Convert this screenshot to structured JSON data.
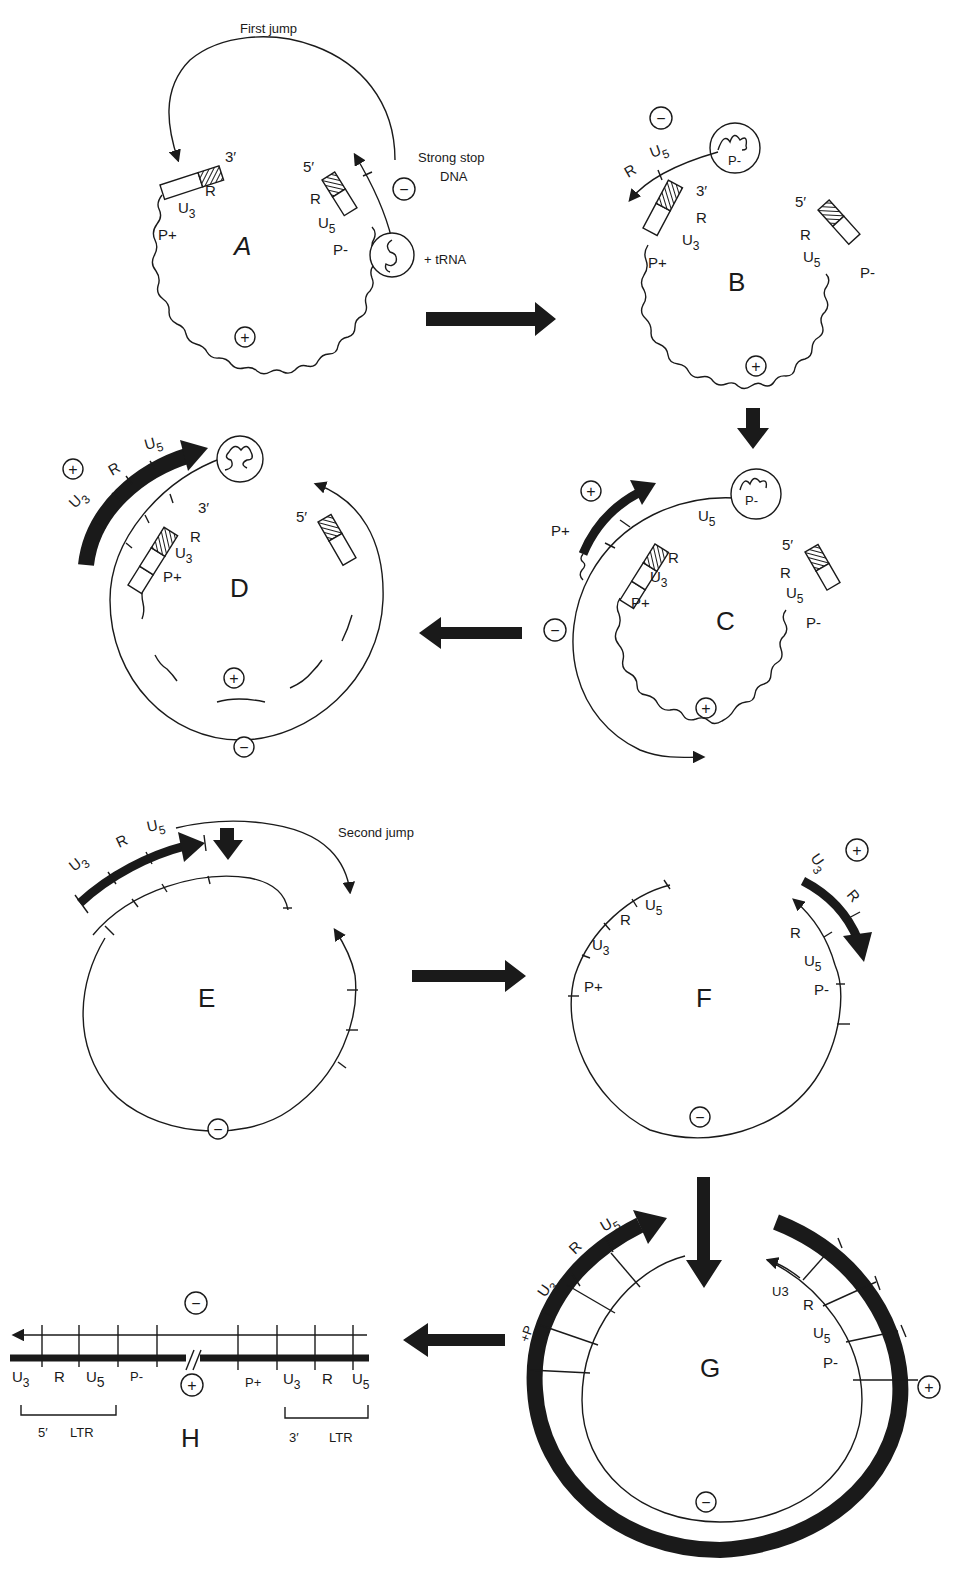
{
  "figure": {
    "ink_color": "#1a1a1a",
    "background": "#ffffff"
  },
  "panels": {
    "A": {
      "letter": "A",
      "title": "First   jump",
      "strong_stop": [
        "Strong stop",
        "DNA"
      ],
      "labels": {
        "three_prime": "3′",
        "five_prime": "5′",
        "R_left": "R",
        "U3": "U",
        "U3_sub": "3",
        "P_plus": "P+",
        "R_right": "R",
        "U5": "U",
        "U5_sub": "5",
        "P_minus": "P-",
        "trna": "+ tRNA"
      },
      "signs": {
        "minus": "−",
        "plus": "+"
      }
    },
    "B": {
      "letter": "B",
      "labels": {
        "R_growing": "R",
        "U5_growing": "U",
        "U5_growing_sub": "5",
        "primer": "P-",
        "three_prime": "3′",
        "R_left": "R",
        "U3": "U",
        "U3_sub": "3",
        "P_plus": "P+",
        "five_prime": "5′",
        "R_right": "R",
        "U5": "U",
        "U5_sub": "5",
        "P_minus": "P-"
      },
      "signs": {
        "minus": "−",
        "plus": "+"
      }
    },
    "C": {
      "letter": "C",
      "labels": {
        "P_plus_new": "P+",
        "U5_top": "U",
        "U5_top_sub": "5",
        "primer": "P-",
        "R_left": "R",
        "U3": "U",
        "U3_sub": "3",
        "P_plus": "P+",
        "five_prime": "5′",
        "R_right": "R",
        "U5": "U",
        "U5_sub": "5",
        "P_minus": "P-"
      },
      "signs": {
        "plus_top": "+",
        "minus": "−",
        "plus": "+"
      }
    },
    "D": {
      "letter": "D",
      "labels": {
        "U3_arrow": "U",
        "U3_arrow_sub": "3",
        "R_arrow": "R",
        "U5_arrow": "U",
        "U5_arrow_sub": "5",
        "three_prime": "3′",
        "R": "R",
        "U3": "U",
        "U3_sub": "3",
        "P_plus": "P+",
        "five_prime": "5′"
      },
      "signs": {
        "plus_top": "+",
        "plus": "+",
        "minus": "−"
      }
    },
    "E": {
      "letter": "E",
      "title": "Second jump",
      "labels": {
        "U3": "U",
        "U3_sub": "3",
        "R": "R",
        "U5": "U",
        "U5_sub": "5"
      },
      "signs": {
        "minus": "−"
      }
    },
    "F": {
      "letter": "F",
      "labels": {
        "U5_left": "U",
        "U5_left_sub": "5",
        "R_left": "R",
        "U3_left": "U",
        "U3_left_sub": "3",
        "P_plus": "P+",
        "U3_right": "U",
        "U3_right_sub": "3",
        "R_right_thick": "R",
        "R_right": "R",
        "U5_right": "U",
        "U5_right_sub": "5",
        "P_minus": "P-"
      },
      "signs": {
        "plus": "+",
        "minus": "−"
      }
    },
    "G": {
      "letter": "G",
      "labels": {
        "P_plus": "+P",
        "U3_left": "U",
        "U3_left_sub": "3",
        "R_left": "R",
        "U5_left": "U",
        "U5_left_sub": "5",
        "U3_right": "U3",
        "R_right": "R",
        "U5_right": "U",
        "U5_right_sub": "5",
        "P_minus": "P-"
      },
      "signs": {
        "plus": "+",
        "minus": "−"
      }
    },
    "H": {
      "letter": "H",
      "segments_bottom": [
        {
          "text": "U",
          "sub": "3"
        },
        {
          "text": "R",
          "sub": ""
        },
        {
          "text": "U",
          "sub": "5"
        },
        {
          "text": "P-",
          "sub": ""
        },
        {
          "text": "P+",
          "sub": ""
        },
        {
          "text": "U",
          "sub": "3"
        },
        {
          "text": "R",
          "sub": ""
        },
        {
          "text": "U",
          "sub": "5"
        }
      ],
      "ltr_left": {
        "prime": "5′",
        "label": "LTR"
      },
      "ltr_right": {
        "prime": "3′",
        "label": "LTR"
      },
      "signs": {
        "minus": "−",
        "plus": "+"
      }
    }
  },
  "flow_arrows": [
    {
      "from": "A",
      "to": "B",
      "direction": "right"
    },
    {
      "from": "B",
      "to": "C",
      "direction": "down"
    },
    {
      "from": "C",
      "to": "D",
      "direction": "left"
    },
    {
      "from": "E",
      "to": "F",
      "direction": "right"
    },
    {
      "from": "F",
      "to": "G",
      "direction": "down"
    },
    {
      "from": "G",
      "to": "H",
      "direction": "left"
    }
  ]
}
